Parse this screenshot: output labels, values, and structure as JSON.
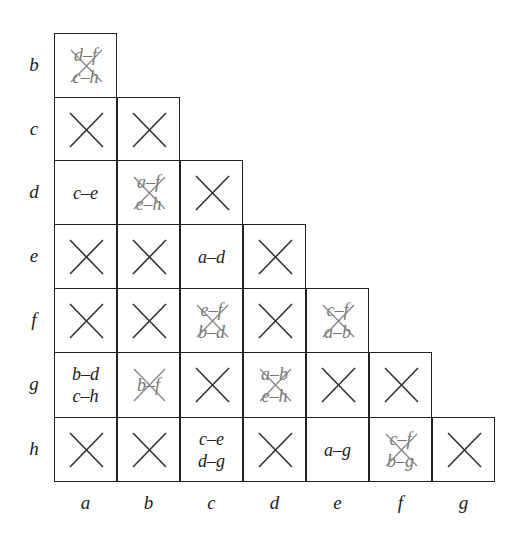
{
  "figure": {
    "type": "implication-table",
    "row_labels": [
      "b",
      "c",
      "d",
      "e",
      "f",
      "g",
      "h"
    ],
    "col_labels": [
      "a",
      "b",
      "c",
      "d",
      "e",
      "f",
      "g"
    ],
    "colors": {
      "line": "#222222",
      "cross": "#333333",
      "light_cross": "#888888",
      "crossed_text": "#777777"
    },
    "cells": [
      {
        "row": "b",
        "col": "a",
        "status": "crossed-pairs",
        "pairs": [
          "d–f",
          "c–h"
        ]
      },
      {
        "row": "c",
        "col": "a",
        "status": "x"
      },
      {
        "row": "c",
        "col": "b",
        "status": "x"
      },
      {
        "row": "d",
        "col": "a",
        "status": "pairs",
        "pairs": [
          "c–e"
        ]
      },
      {
        "row": "d",
        "col": "b",
        "status": "crossed-pairs",
        "pairs": [
          "a–f",
          "e–h"
        ]
      },
      {
        "row": "d",
        "col": "c",
        "status": "x"
      },
      {
        "row": "e",
        "col": "a",
        "status": "x"
      },
      {
        "row": "e",
        "col": "b",
        "status": "x"
      },
      {
        "row": "e",
        "col": "c",
        "status": "pairs",
        "pairs": [
          "a–d"
        ]
      },
      {
        "row": "e",
        "col": "d",
        "status": "x"
      },
      {
        "row": "f",
        "col": "a",
        "status": "x"
      },
      {
        "row": "f",
        "col": "b",
        "status": "x"
      },
      {
        "row": "f",
        "col": "c",
        "status": "crossed-pairs",
        "pairs": [
          "e–f",
          "b–d"
        ]
      },
      {
        "row": "f",
        "col": "d",
        "status": "x"
      },
      {
        "row": "f",
        "col": "e",
        "status": "crossed-pairs",
        "pairs": [
          "c–f",
          "a–b"
        ]
      },
      {
        "row": "g",
        "col": "a",
        "status": "pairs",
        "pairs": [
          "b–d",
          "c–h"
        ]
      },
      {
        "row": "g",
        "col": "b",
        "status": "crossed-pairs",
        "pairs": [
          "b–f"
        ]
      },
      {
        "row": "g",
        "col": "c",
        "status": "x"
      },
      {
        "row": "g",
        "col": "d",
        "status": "crossed-pairs",
        "pairs": [
          "a–b",
          "e–h"
        ]
      },
      {
        "row": "g",
        "col": "e",
        "status": "x"
      },
      {
        "row": "g",
        "col": "f",
        "status": "x"
      },
      {
        "row": "h",
        "col": "a",
        "status": "x"
      },
      {
        "row": "h",
        "col": "b",
        "status": "x"
      },
      {
        "row": "h",
        "col": "c",
        "status": "pairs",
        "pairs": [
          "c–e",
          "d–g"
        ]
      },
      {
        "row": "h",
        "col": "d",
        "status": "x"
      },
      {
        "row": "h",
        "col": "e",
        "status": "pairs",
        "pairs": [
          "a–g"
        ]
      },
      {
        "row": "h",
        "col": "f",
        "status": "crossed-pairs",
        "pairs": [
          "c–f",
          "b–g"
        ]
      },
      {
        "row": "h",
        "col": "g",
        "status": "x"
      }
    ]
  }
}
